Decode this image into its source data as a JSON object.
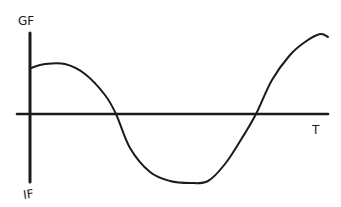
{
  "chart_data": {
    "type": "line",
    "title": "",
    "style": "hand-drawn sketch",
    "ylabel_top": "GF",
    "ylabel_bottom": "IF",
    "xlabel": "T",
    "axes": {
      "y_axis": {
        "x": 30,
        "y_top": 33,
        "y_bottom": 182
      },
      "x_axis": {
        "y": 114,
        "x_start": 17,
        "x_end": 328
      }
    },
    "series": [
      {
        "name": "curve",
        "description": "wave starting high near GF, descending through T axis to a flat trough near IF, then rising back above the axis to a peak at the right",
        "points": [
          [
            31,
            68
          ],
          [
            45,
            64
          ],
          [
            65,
            64
          ],
          [
            85,
            74
          ],
          [
            105,
            95
          ],
          [
            116,
            114
          ],
          [
            130,
            148
          ],
          [
            150,
            172
          ],
          [
            170,
            181
          ],
          [
            190,
            183
          ],
          [
            208,
            181
          ],
          [
            225,
            164
          ],
          [
            242,
            138
          ],
          [
            256,
            114
          ],
          [
            272,
            80
          ],
          [
            290,
            55
          ],
          [
            305,
            42
          ],
          [
            320,
            34
          ],
          [
            328,
            37
          ]
        ]
      }
    ],
    "grid": false,
    "legend": null
  },
  "labels": {
    "top": "GF",
    "bottom": "IF",
    "right": "T"
  },
  "colors": {
    "ink": "#1a1a1a",
    "background": "#ffffff"
  }
}
